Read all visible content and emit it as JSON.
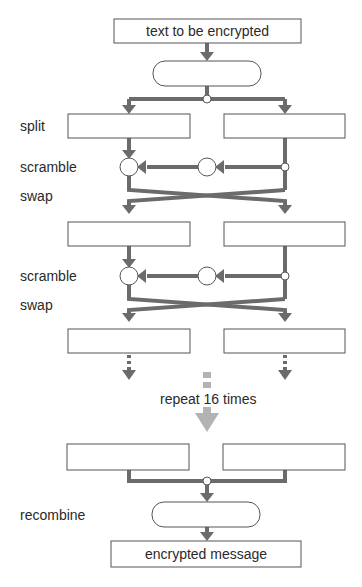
{
  "diagram": {
    "title_box": "text to be encrypted",
    "output_box": "encrypted message",
    "step_labels": {
      "split": "split",
      "scramble_1": "scramble",
      "swap_1": "swap",
      "scramble_2": "scramble",
      "swap_2": "swap",
      "recombine": "recombine"
    },
    "repeat_label": "repeat 16 times",
    "colors": {
      "line": "#6b6b6b",
      "box_border": "#555555",
      "repeat_arrow": "#b0b0b0",
      "background": "#ffffff"
    }
  }
}
